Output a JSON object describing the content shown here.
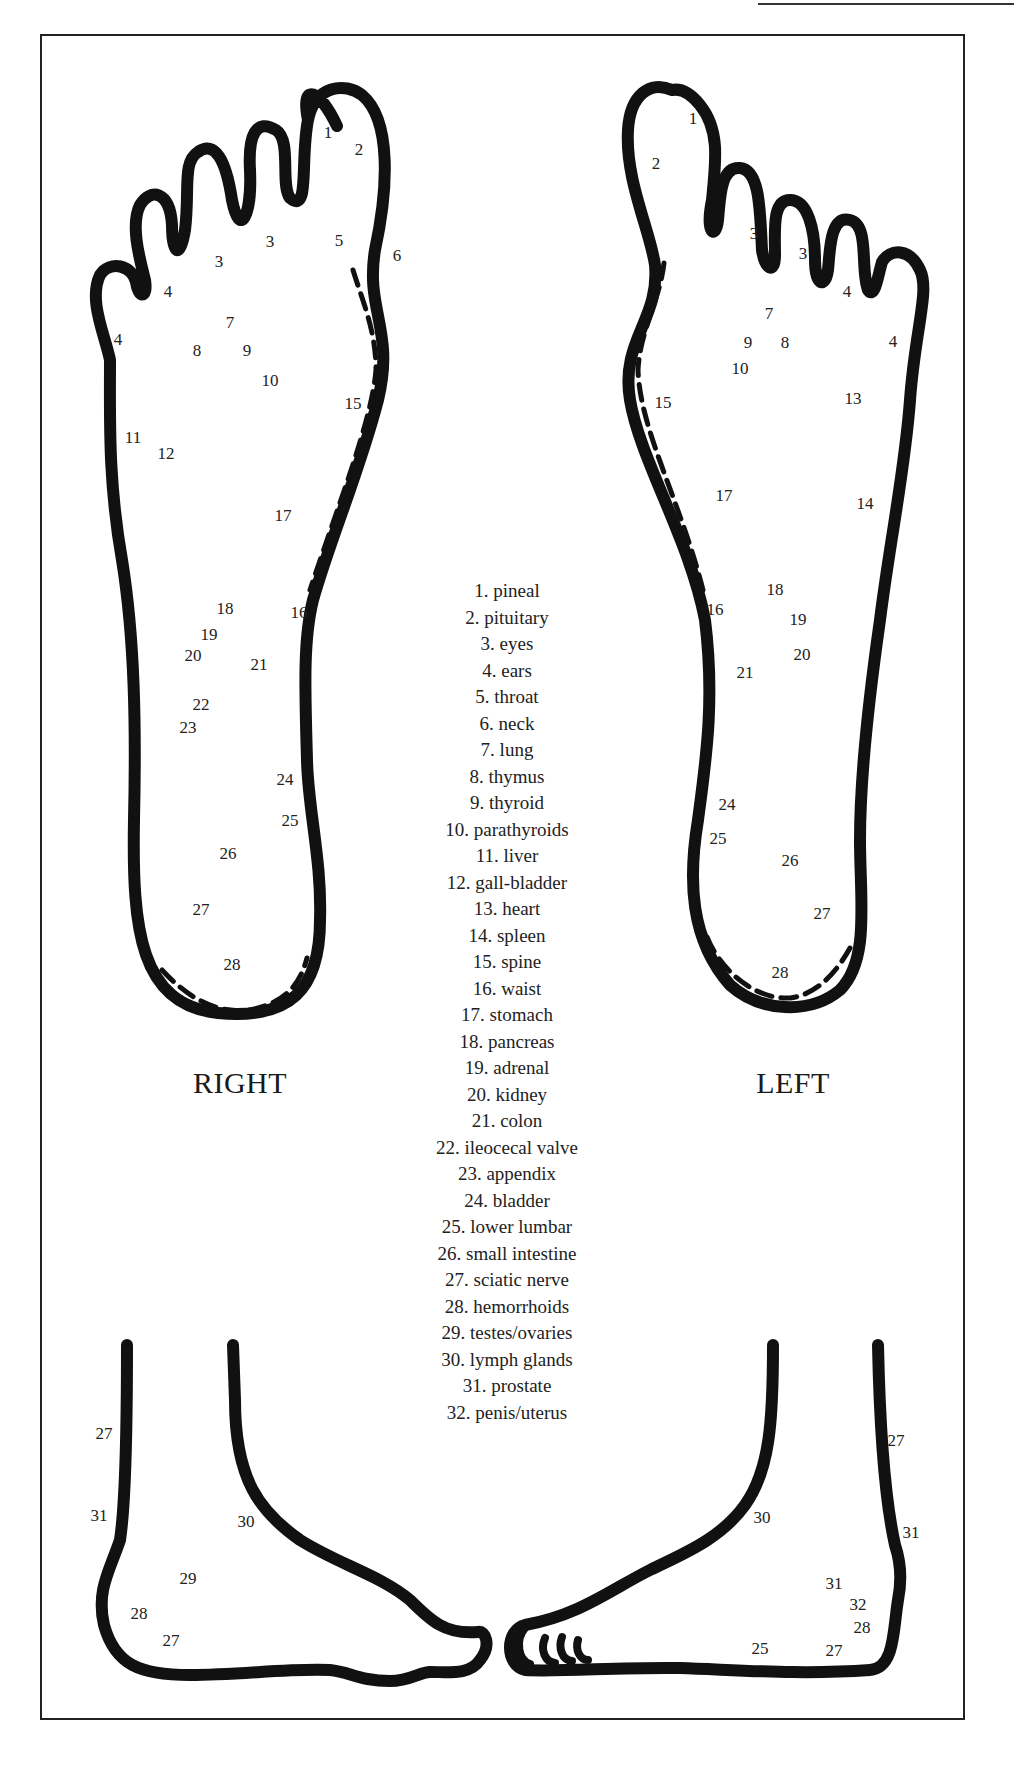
{
  "labels": {
    "right_foot": "RIGHT",
    "left_foot": "LEFT"
  },
  "legend": [
    "1. pineal",
    "2. pituitary",
    "3. eyes",
    "4. ears",
    "5. throat",
    "6. neck",
    "7. lung",
    "8. thymus",
    "9. thyroid",
    "10. parathyroids",
    "11. liver",
    "12. gall-bladder",
    "13. heart",
    "14. spleen",
    "15. spine",
    "16. waist",
    "17. stomach",
    "18. pancreas",
    "19. adrenal",
    "20. kidney",
    "21. colon",
    "22. ileocecal valve",
    "23. appendix",
    "24. bladder",
    "25. lower lumbar",
    "26. small intestine",
    "27. sciatic nerve",
    "28. hemorrhoids",
    "29. testes/ovaries",
    "30. lymph glands",
    "31. prostate",
    "32. penis/uterus"
  ],
  "right_sole_points": [
    {
      "n": "1",
      "x": 328,
      "y": 132
    },
    {
      "n": "2",
      "x": 359,
      "y": 149
    },
    {
      "n": "3",
      "x": 270,
      "y": 241
    },
    {
      "n": "3",
      "x": 219,
      "y": 261
    },
    {
      "n": "4",
      "x": 168,
      "y": 291
    },
    {
      "n": "4",
      "x": 118,
      "y": 339
    },
    {
      "n": "5",
      "x": 339,
      "y": 240
    },
    {
      "n": "6",
      "x": 397,
      "y": 255
    },
    {
      "n": "7",
      "x": 230,
      "y": 322
    },
    {
      "n": "8",
      "x": 197,
      "y": 350
    },
    {
      "n": "9",
      "x": 247,
      "y": 350
    },
    {
      "n": "10",
      "x": 270,
      "y": 380
    },
    {
      "n": "11",
      "x": 133,
      "y": 437
    },
    {
      "n": "12",
      "x": 166,
      "y": 453
    },
    {
      "n": "15",
      "x": 353,
      "y": 403
    },
    {
      "n": "17",
      "x": 283,
      "y": 515
    },
    {
      "n": "18",
      "x": 225,
      "y": 608
    },
    {
      "n": "16",
      "x": 299,
      "y": 612
    },
    {
      "n": "19",
      "x": 209,
      "y": 634
    },
    {
      "n": "20",
      "x": 193,
      "y": 655
    },
    {
      "n": "21",
      "x": 259,
      "y": 664
    },
    {
      "n": "22",
      "x": 201,
      "y": 704
    },
    {
      "n": "23",
      "x": 188,
      "y": 727
    },
    {
      "n": "24",
      "x": 285,
      "y": 779
    },
    {
      "n": "25",
      "x": 290,
      "y": 820
    },
    {
      "n": "26",
      "x": 228,
      "y": 853
    },
    {
      "n": "27",
      "x": 201,
      "y": 909
    },
    {
      "n": "28",
      "x": 232,
      "y": 964
    }
  ],
  "left_sole_points": [
    {
      "n": "1",
      "x": 693,
      "y": 118
    },
    {
      "n": "2",
      "x": 656,
      "y": 163
    },
    {
      "n": "3",
      "x": 754,
      "y": 233
    },
    {
      "n": "3",
      "x": 803,
      "y": 253
    },
    {
      "n": "4",
      "x": 847,
      "y": 291
    },
    {
      "n": "4",
      "x": 893,
      "y": 341
    },
    {
      "n": "7",
      "x": 769,
      "y": 313
    },
    {
      "n": "9",
      "x": 748,
      "y": 342
    },
    {
      "n": "8",
      "x": 785,
      "y": 342
    },
    {
      "n": "10",
      "x": 740,
      "y": 368
    },
    {
      "n": "13",
      "x": 853,
      "y": 398
    },
    {
      "n": "15",
      "x": 663,
      "y": 402
    },
    {
      "n": "17",
      "x": 724,
      "y": 495
    },
    {
      "n": "14",
      "x": 865,
      "y": 503
    },
    {
      "n": "18",
      "x": 775,
      "y": 589
    },
    {
      "n": "16",
      "x": 715,
      "y": 609
    },
    {
      "n": "19",
      "x": 798,
      "y": 619
    },
    {
      "n": "20",
      "x": 802,
      "y": 654
    },
    {
      "n": "21",
      "x": 745,
      "y": 672
    },
    {
      "n": "24",
      "x": 727,
      "y": 804
    },
    {
      "n": "25",
      "x": 718,
      "y": 838
    },
    {
      "n": "26",
      "x": 790,
      "y": 860
    },
    {
      "n": "27",
      "x": 822,
      "y": 913
    },
    {
      "n": "28",
      "x": 780,
      "y": 972
    }
  ],
  "right_side_points": [
    {
      "n": "27",
      "x": 104,
      "y": 1433
    },
    {
      "n": "31",
      "x": 99,
      "y": 1515
    },
    {
      "n": "30",
      "x": 246,
      "y": 1521
    },
    {
      "n": "29",
      "x": 188,
      "y": 1578
    },
    {
      "n": "28",
      "x": 139,
      "y": 1613
    },
    {
      "n": "27",
      "x": 171,
      "y": 1640
    }
  ],
  "left_side_points": [
    {
      "n": "30",
      "x": 762,
      "y": 1517
    },
    {
      "n": "27",
      "x": 896,
      "y": 1440
    },
    {
      "n": "31",
      "x": 911,
      "y": 1532
    },
    {
      "n": "31",
      "x": 834,
      "y": 1583
    },
    {
      "n": "32",
      "x": 858,
      "y": 1604
    },
    {
      "n": "28",
      "x": 862,
      "y": 1627
    },
    {
      "n": "25",
      "x": 760,
      "y": 1648
    },
    {
      "n": "27",
      "x": 834,
      "y": 1650
    }
  ]
}
